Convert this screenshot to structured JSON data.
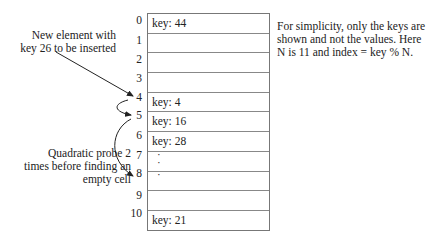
{
  "diagram": {
    "type": "hash-table-quadratic-probing",
    "annotations": {
      "new_element": "New element with key 26 to be inserted",
      "probe": "Quadratic probe 2 times before finding an empty cell",
      "description": "For simplicity, only the keys are shown and not the values. Here N is 11 and index = key % N."
    },
    "table": {
      "rows": [
        {
          "index": "0",
          "content": "key: 44"
        },
        {
          "index": "1",
          "content": ""
        },
        {
          "index": "2",
          "content": ""
        },
        {
          "index": "3",
          "content": ""
        },
        {
          "index": "4",
          "content": "key: 4"
        },
        {
          "index": "5",
          "content": "key: 16"
        },
        {
          "index": "6",
          "content": "key: 28"
        },
        {
          "index": "7",
          "content": ""
        },
        {
          "index": "8",
          "content": ""
        },
        {
          "index": "9",
          "content": ""
        },
        {
          "index": "10",
          "content": "key: 21"
        }
      ]
    },
    "arrows": [
      {
        "from": "new-element-label",
        "to": "index-4"
      },
      {
        "from": "index-4",
        "to": "index-5"
      },
      {
        "from": "index-5",
        "to": "index-8"
      }
    ]
  }
}
